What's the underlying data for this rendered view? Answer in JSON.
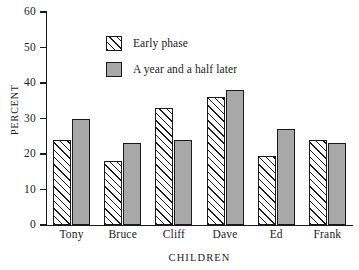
{
  "chart_data": {
    "type": "bar",
    "title": "",
    "xlabel": "CHILDREN",
    "ylabel": "PERCENT",
    "categories": [
      "Tony",
      "Bruce",
      "Cliff",
      "Dave",
      "Ed",
      "Frank"
    ],
    "series": [
      {
        "name": "Early phase",
        "values": [
          24,
          18,
          33,
          36,
          19.5,
          24
        ],
        "fill": "hatch",
        "color": "#ffffff"
      },
      {
        "name": "A year and a half later",
        "values": [
          30,
          23,
          24,
          38,
          27,
          23
        ],
        "fill": "solid",
        "color": "#a8a8a8"
      }
    ],
    "ylim": [
      0,
      60
    ],
    "yticks": [
      0,
      10,
      20,
      30,
      40,
      50,
      60
    ],
    "ytick_labels": [
      "0",
      "10",
      "20",
      "30",
      "40",
      "50",
      "60"
    ],
    "grid": false,
    "legend_position": "upper-left-inside"
  },
  "legend": {
    "items": [
      {
        "label": "Early phase",
        "swatch": "hatched-square-icon"
      },
      {
        "label": "A year and a half later",
        "swatch": "gray-square-icon"
      }
    ]
  },
  "axis": {
    "y_title": "PERCENT",
    "x_title": "CHILDREN"
  }
}
